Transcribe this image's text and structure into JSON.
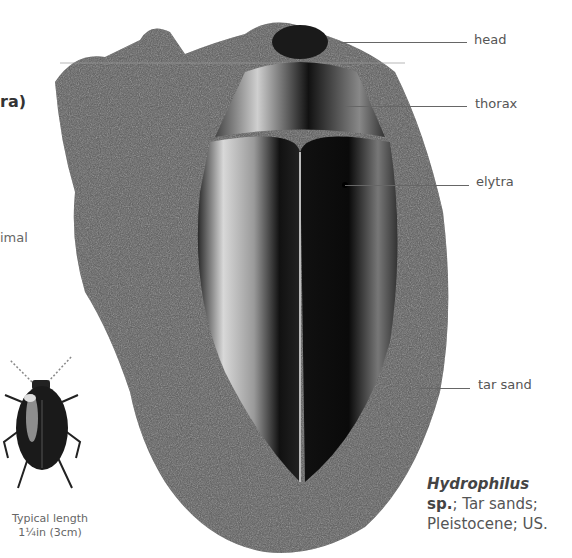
{
  "partial_text": {
    "heading_fragment": "ra)",
    "body_fragment": "imal"
  },
  "labels": [
    {
      "id": "head",
      "text": "head"
    },
    {
      "id": "thorax",
      "text": "thorax"
    },
    {
      "id": "elytra",
      "text": "elytra"
    },
    {
      "id": "tar-sand",
      "text": "tar sand"
    }
  ],
  "illustration": {
    "typical_length_line1": "Typical length",
    "typical_length_line2": "1¼in (3cm)"
  },
  "caption": {
    "genus": "Hydrophilus",
    "line2_bold": "sp.",
    "line2_rest": "; Tar sands;",
    "line3": "Pleistocene; US."
  },
  "colors": {
    "rock": "#555555",
    "beetle": "#1a1a1a",
    "text": "#555555",
    "leader": "#666666"
  }
}
